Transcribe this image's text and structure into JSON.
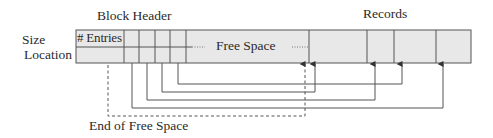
{
  "diagram": {
    "type": "slotted-page-structure",
    "labels": {
      "block_header": "Block Header",
      "records": "Records",
      "size": "Size",
      "location": "Location",
      "entries": "# Entries",
      "free_space": "Free Space",
      "end_of_free_space": "End of Free Space",
      "ellipsis": "......"
    },
    "colors": {
      "cell_fill": "#e8e8e8",
      "line": "#555555",
      "background": "#ffffff"
    },
    "header_slots": 4,
    "records_count": 4,
    "pointers": [
      {
        "from_slot": 1,
        "to_record": 4
      },
      {
        "from_slot": 2,
        "to_record": 2
      },
      {
        "from_slot": 3,
        "to_record": 1
      },
      {
        "from_slot": 4,
        "to_record": 3
      }
    ]
  }
}
